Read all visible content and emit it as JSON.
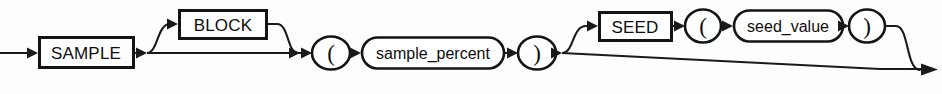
{
  "diagram": {
    "kind": "railroad-syntax-diagram",
    "name": "sample_clause",
    "canvas": {
      "width": 942,
      "height": 94
    },
    "background_color": "#fdfdfd",
    "line_color": "#1a1a1a",
    "text_color": "#0d0d0d",
    "fill_color": "#ffffff",
    "main_baseline_y": 53,
    "upper_branch_y": 24,
    "entry": {
      "x": 0,
      "y": 53,
      "arrow_at_x": 38
    },
    "exit": {
      "x": 938,
      "y": 70,
      "arrow_at_x": 932
    },
    "nodes": [
      {
        "id": "sample-keyword",
        "type": "terminal-box",
        "label": "SAMPLE",
        "required": true,
        "x": 38,
        "y": 36,
        "width": 97,
        "height": 33,
        "center_x": 86,
        "center_y": 53
      },
      {
        "id": "block-keyword",
        "type": "terminal-box",
        "label": "BLOCK",
        "required": false,
        "x": 178,
        "y": 9,
        "width": 90,
        "height": 31,
        "center_x": 223,
        "center_y": 24
      },
      {
        "id": "open-paren-1",
        "type": "terminal-circle",
        "label": "(",
        "required": true,
        "center_x": 331,
        "center_y": 53,
        "rx": 19,
        "ry": 16
      },
      {
        "id": "sample-percent",
        "type": "nonterminal-oval",
        "label": "sample_percent",
        "required": true,
        "x": 361,
        "y": 37,
        "width": 144,
        "height": 32,
        "center_x": 433,
        "center_y": 53
      },
      {
        "id": "close-paren-1",
        "type": "terminal-circle",
        "label": ")",
        "required": true,
        "center_x": 537,
        "center_y": 53,
        "rx": 19,
        "ry": 16
      },
      {
        "id": "seed-keyword",
        "type": "terminal-box",
        "label": "SEED",
        "required": false,
        "x": 598,
        "y": 11,
        "width": 75,
        "height": 31,
        "center_x": 635,
        "center_y": 26
      },
      {
        "id": "open-paren-2",
        "type": "terminal-circle",
        "label": "(",
        "required": false,
        "center_x": 703,
        "center_y": 26,
        "rx": 18,
        "ry": 16
      },
      {
        "id": "seed-value",
        "type": "nonterminal-oval",
        "label": "seed_value",
        "required": false,
        "x": 733,
        "y": 10,
        "width": 111,
        "height": 32,
        "center_x": 788,
        "center_y": 26
      },
      {
        "id": "close-paren-2",
        "type": "terminal-circle",
        "label": ")",
        "required": false,
        "center_x": 867,
        "center_y": 26,
        "rx": 18,
        "ry": 16
      }
    ],
    "branches": [
      {
        "id": "block-optional-branch",
        "description": "optional BLOCK keyword above main line",
        "split_x": 147,
        "merge_x": 298,
        "branch_y": 24
      },
      {
        "id": "seed-optional-branch",
        "description": "optional SEED ( seed_value ) group above main line",
        "split_x": 562,
        "merge_x": 920,
        "branch_y": 26
      }
    ],
    "grammar": "SAMPLE [ BLOCK ] ( sample_percent ) [ SEED ( seed_value ) ]"
  }
}
